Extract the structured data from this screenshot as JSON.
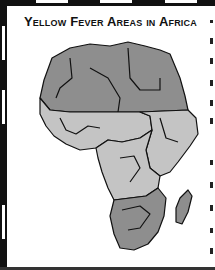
{
  "figure": {
    "title": "Yellow Fever Areas in Africa",
    "legend_colors": {
      "yellow_fever_area": "#c4c4c4",
      "non_endemic_area": "#8e8e8e",
      "border": "#111111",
      "ocean": "#ffffff"
    },
    "map": {
      "subject": "Africa",
      "regions": [
        {
          "name": "North Africa",
          "shade": "dark"
        },
        {
          "name": "West Africa coastal",
          "shade": "light"
        },
        {
          "name": "Central Africa",
          "shade": "light"
        },
        {
          "name": "East Africa",
          "shade": "light"
        },
        {
          "name": "Southern Africa",
          "shade": "dark"
        },
        {
          "name": "Madagascar",
          "shade": "dark"
        }
      ]
    }
  }
}
